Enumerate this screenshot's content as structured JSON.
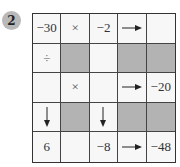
{
  "puzzle": {
    "number": "2",
    "shaded_color": "#b3b3b3",
    "rows": [
      [
        {
          "type": "value",
          "text": "−30"
        },
        {
          "type": "op",
          "text": "×",
          "icon": "multiply-icon"
        },
        {
          "type": "value",
          "text": "−2"
        },
        {
          "type": "arrow",
          "icon": "arrow-right-icon"
        },
        {
          "type": "blank",
          "text": ""
        }
      ],
      [
        {
          "type": "op",
          "text": "÷",
          "icon": "divide-icon"
        },
        {
          "type": "shaded"
        },
        {
          "type": "blank",
          "text": ""
        },
        {
          "type": "shaded"
        },
        {
          "type": "shaded"
        }
      ],
      [
        {
          "type": "blank",
          "text": ""
        },
        {
          "type": "op",
          "text": "×",
          "icon": "multiply-icon"
        },
        {
          "type": "blank",
          "text": ""
        },
        {
          "type": "arrow",
          "icon": "arrow-right-icon"
        },
        {
          "type": "value",
          "text": "−20"
        }
      ],
      [
        {
          "type": "arrow",
          "icon": "arrow-down-icon"
        },
        {
          "type": "shaded"
        },
        {
          "type": "arrow",
          "icon": "arrow-down-icon"
        },
        {
          "type": "shaded"
        },
        {
          "type": "shaded"
        }
      ],
      [
        {
          "type": "value",
          "text": "6"
        },
        {
          "type": "blank",
          "text": ""
        },
        {
          "type": "value",
          "text": "−8"
        },
        {
          "type": "arrow",
          "icon": "arrow-right-icon"
        },
        {
          "type": "value",
          "text": "−48"
        }
      ]
    ]
  }
}
